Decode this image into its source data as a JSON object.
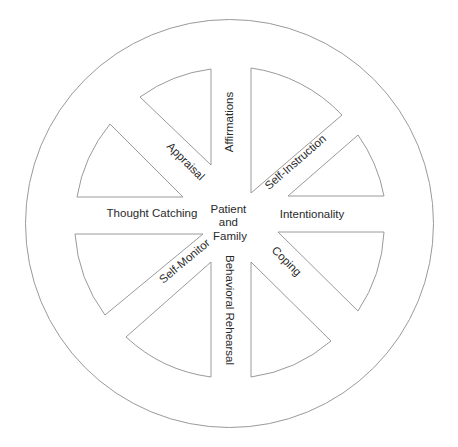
{
  "diagram": {
    "type": "wheel",
    "center": {
      "lines": [
        "Patient",
        "and",
        "Family"
      ]
    },
    "spokes": [
      {
        "label": "Affirmations",
        "direction": "up"
      },
      {
        "label": "Self-Instruction",
        "direction": "upper-right"
      },
      {
        "label": "Intentionality",
        "direction": "right"
      },
      {
        "label": "Coping",
        "direction": "lower-right"
      },
      {
        "label": "Behavioral Rehearsal",
        "direction": "down"
      },
      {
        "label": "Self-Monitor",
        "direction": "lower-left"
      },
      {
        "label": "Thought Catching",
        "direction": "left"
      },
      {
        "label": "Appraisal",
        "direction": "upper-left"
      }
    ],
    "colors": {
      "stroke": "#9a9a9a",
      "text": "#2a2a2a",
      "background": "#ffffff"
    }
  }
}
